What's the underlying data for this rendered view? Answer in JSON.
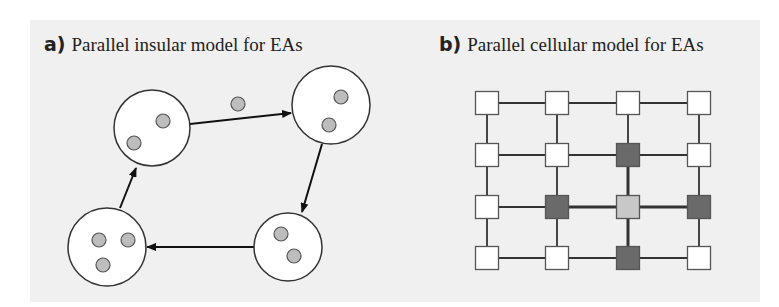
{
  "panel_a": {
    "letter": "a)",
    "title": "Parallel insular model for EAs",
    "islands": [
      {
        "id": "A",
        "cx": 152,
        "cy": 128,
        "r": 38,
        "individuals": [
          [
            134,
            143
          ],
          [
            163,
            121
          ]
        ]
      },
      {
        "id": "B",
        "cx": 331,
        "cy": 105,
        "r": 39,
        "individuals": [
          [
            341,
            97
          ],
          [
            329,
            125
          ]
        ]
      },
      {
        "id": "C",
        "cx": 288,
        "cy": 247,
        "r": 34,
        "individuals": [
          [
            281,
            234
          ],
          [
            294,
            256
          ]
        ]
      },
      {
        "id": "D",
        "cx": 107,
        "cy": 247,
        "r": 39,
        "individuals": [
          [
            99,
            240
          ],
          [
            128,
            240
          ],
          [
            103,
            265
          ]
        ]
      }
    ],
    "migrant": {
      "cx": 238,
      "cy": 104,
      "r": 7
    },
    "migrations": [
      {
        "from": "A",
        "to": "B",
        "x1": 190,
        "y1": 124,
        "x2": 291,
        "y2": 113
      },
      {
        "from": "B",
        "to": "C",
        "x1": 322,
        "y1": 144,
        "x2": 302,
        "y2": 212
      },
      {
        "from": "C",
        "to": "D",
        "x1": 254,
        "y1": 247,
        "x2": 147,
        "y2": 247
      },
      {
        "from": "D",
        "to": "A",
        "x1": 120,
        "y1": 208,
        "x2": 136,
        "y2": 168
      }
    ]
  },
  "panel_b": {
    "letter": "b)",
    "title": "Parallel cellular model for EAs",
    "columns_x": [
      487,
      557,
      628,
      699
    ],
    "rows_y": [
      103,
      155,
      207,
      258
    ],
    "cell_size": 23,
    "cells": [
      [
        "white",
        "white",
        "white",
        "white"
      ],
      [
        "white",
        "white",
        "dark",
        "white"
      ],
      [
        "white",
        "dark",
        "light",
        "dark"
      ],
      [
        "white",
        "white",
        "dark",
        "white"
      ]
    ],
    "highlight_center": [
      2,
      2
    ]
  },
  "colors": {
    "panel_bg": "#f0f0f0",
    "stroke": "#333333",
    "individual_fill": "#bdbdbd",
    "cell_white": "#ffffff",
    "cell_dark": "#6a6a6a",
    "cell_light": "#c8c8c8"
  }
}
